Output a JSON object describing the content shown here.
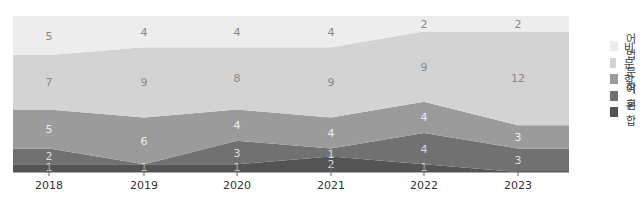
{
  "chart_data": {
    "type": "area",
    "stacked": true,
    "title": "",
    "xlabel": "",
    "ylabel": "",
    "categories": [
      "2018",
      "2019",
      "2020",
      "2021",
      "2022",
      "2023"
    ],
    "series": [
      {
        "name": "혼합",
        "values": [
          1,
          1,
          1,
          2,
          1,
          0
        ],
        "color": "#545454",
        "label_color": "#dddddd"
      },
      {
        "name": "어휘",
        "values": [
          2,
          0,
          3,
          1,
          4,
          3
        ],
        "color": "#717171",
        "label_color": "#dddddd"
      },
      {
        "name": "문학",
        "values": [
          5,
          6,
          4,
          4,
          4,
          3
        ],
        "color": "#9b9b9b",
        "label_color": "#eeeeee"
      },
      {
        "name": "비문학",
        "values": [
          7,
          9,
          8,
          9,
          9,
          12
        ],
        "color": "#d3d3d3",
        "label_color": "#888888"
      },
      {
        "name": "어법",
        "values": [
          5,
          4,
          4,
          4,
          2,
          2
        ],
        "color": "#ededed",
        "label_color": "#888888"
      }
    ],
    "point_labels": {
      "혼합": [
        "1",
        "1",
        "1",
        "2",
        "1",
        ""
      ],
      "어휘": [
        "2",
        "",
        "3",
        "1",
        "4",
        "3"
      ],
      "문학": [
        "5",
        "6",
        "4",
        "4",
        "4",
        "3"
      ],
      "비문학": [
        "7",
        "9",
        "8",
        "9",
        "9",
        "12"
      ],
      "어법": [
        "5",
        "4",
        "4",
        "4",
        "2",
        "2"
      ]
    },
    "ylim": [
      0,
      20
    ],
    "grid": false,
    "legend_position": "right"
  },
  "legend": {
    "items": [
      {
        "label": "어법",
        "color": "#ededed"
      },
      {
        "label": "비문학",
        "color": "#d3d3d3"
      },
      {
        "label": "문학",
        "color": "#9b9b9b"
      },
      {
        "label": "어휘",
        "color": "#717171"
      },
      {
        "label": "혼합",
        "color": "#545454"
      }
    ]
  }
}
